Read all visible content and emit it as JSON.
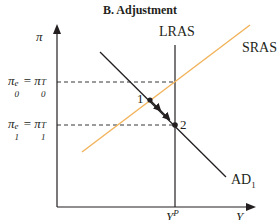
{
  "title": "B. Adjustment",
  "axes": {
    "y_label": "π",
    "x_label": "Y",
    "x_tick_base": "Y",
    "x_tick_sup": "P"
  },
  "curves": {
    "lras": {
      "label": "LRAS",
      "color": "#231f20"
    },
    "sras": {
      "label": "SRAS",
      "color": "#f2b35b"
    },
    "ad": {
      "label": "AD",
      "sub": "1",
      "color": "#231f20"
    }
  },
  "levels": {
    "upper": {
      "lhs_base": "π",
      "lhs_sup": "e",
      "lhs_sub": "0",
      "eq": "=",
      "rhs_base": "π",
      "rhs_sup": "T",
      "rhs_sub": "0"
    },
    "lower": {
      "lhs_base": "π",
      "lhs_sup": "e",
      "lhs_sub": "1",
      "eq": "=",
      "rhs_base": "π",
      "rhs_sup": "T",
      "rhs_sub": "1"
    }
  },
  "points": [
    {
      "label": "1"
    },
    {
      "label": "2"
    }
  ]
}
